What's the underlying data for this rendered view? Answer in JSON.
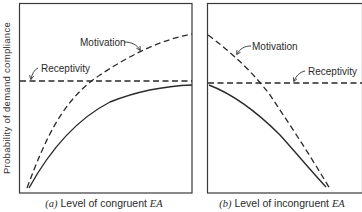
{
  "figure": {
    "y_axis_label": "Probability of demand compliance",
    "panels": [
      {
        "id": "a",
        "caption_prefix": "(a)",
        "caption_text": " Level of congruent ",
        "caption_var": "EA",
        "curves": [
          {
            "name": "Motivation",
            "style": "dashed",
            "trend": "increasing, concave"
          },
          {
            "name": "Receptivity",
            "style": "dashed",
            "trend": "constant"
          },
          {
            "name": "Compliance",
            "style": "solid",
            "trend": "increasing, concave"
          }
        ],
        "labels": {
          "motivation": "Motivation",
          "receptivity": "Receptivity"
        }
      },
      {
        "id": "b",
        "caption_prefix": "(b)",
        "caption_text": " Level of incongruent ",
        "caption_var": "EA",
        "curves": [
          {
            "name": "Motivation",
            "style": "dashed",
            "trend": "decreasing, concave"
          },
          {
            "name": "Receptivity",
            "style": "dashed",
            "trend": "constant"
          },
          {
            "name": "Compliance",
            "style": "solid",
            "trend": "decreasing, concave"
          }
        ],
        "labels": {
          "motivation": "Motivation",
          "receptivity": "Receptivity"
        }
      }
    ],
    "colors": {
      "line": "#2a2a2a",
      "frame": "#3a3a3a",
      "background": "#ffffff"
    }
  }
}
